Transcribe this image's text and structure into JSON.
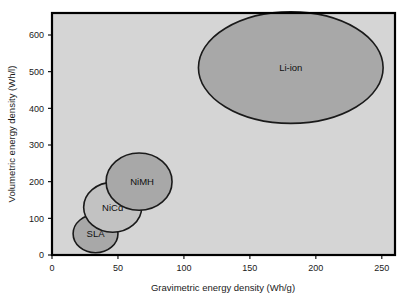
{
  "chart_data": {
    "type": "scatter",
    "title": "",
    "subtitle": "",
    "xlabel": "Gravimetric energy density (Wh/g)",
    "ylabel": "Volumetric energy density (Wh/l)",
    "xlim": [
      0,
      260
    ],
    "ylim": [
      0,
      660
    ],
    "xticks": [
      0,
      50,
      100,
      150,
      200,
      250
    ],
    "yticks": [
      0,
      100,
      200,
      300,
      400,
      500,
      600
    ],
    "xtick_labels": [
      "0",
      "50",
      "100",
      "150",
      "200",
      "250"
    ],
    "ytick_labels": [
      "0",
      "100",
      "200",
      "300",
      "400",
      "500",
      "600"
    ],
    "grid": false,
    "legend": "none",
    "plot_background": "#d5d5d5",
    "frame_color": "#000000",
    "bubbles": [
      {
        "label": "SLA",
        "x": 33,
        "y": 58,
        "rx": 17,
        "ry": 52,
        "fill": "#a8a8a8",
        "stroke": "#1a1a1a",
        "label_dx": 0,
        "label_dy": 0
      },
      {
        "label": "NiCd",
        "x": 46,
        "y": 130,
        "rx": 22,
        "ry": 68,
        "fill": "#c2c2c2",
        "stroke": "#1a1a1a",
        "label_dx": 0,
        "label_dy": 0
      },
      {
        "label": "NiMH",
        "x": 66,
        "y": 200,
        "rx": 25,
        "ry": 78,
        "fill": "#a8a8a8",
        "stroke": "#1a1a1a",
        "label_dx": 3,
        "label_dy": 0
      },
      {
        "label": "Li-ion",
        "x": 181,
        "y": 511,
        "rx": 70,
        "ry": 152,
        "fill": "#a8a8a8",
        "stroke": "#1a1a1a",
        "label_dx": 0,
        "label_dy": 0
      }
    ]
  },
  "axes": {
    "x_title": "Gravimetric energy density (Wh/g)",
    "y_title": "Volumetric energy density (Wh/l)"
  }
}
